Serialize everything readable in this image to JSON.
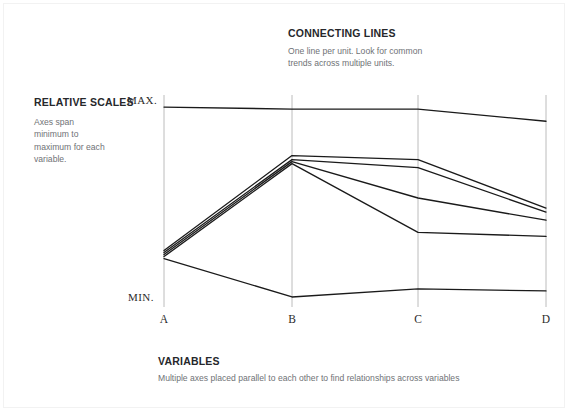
{
  "callouts": {
    "connecting": {
      "title": "CONNECTING LINES",
      "body": "One line per unit. Look for common trends across multiple units."
    },
    "relative": {
      "title": "RELATIVE SCALES",
      "body": "Axes span minimum to maximum for each variable."
    },
    "variables": {
      "title": "VARIABLES",
      "body": "Multiple axes placed parallel to each other to find relationships across variables"
    }
  },
  "chart_data": {
    "type": "line",
    "subtype": "parallel-coordinates",
    "title": "",
    "xlabel": "",
    "ylabel": "",
    "categories": [
      "A",
      "B",
      "C",
      "D"
    ],
    "axis_max_label": "MAX.",
    "axis_min_label": "MIN.",
    "ylim": [
      0,
      100
    ],
    "grid": false,
    "legend": "none",
    "line_color": "#1a1a1a",
    "axis_color": "#bcbcbc",
    "series": [
      {
        "name": "unit-1",
        "values": [
          96,
          95,
          95,
          89
        ]
      },
      {
        "name": "unit-2",
        "values": [
          25,
          72,
          70,
          46
        ]
      },
      {
        "name": "unit-3",
        "values": [
          24,
          70,
          66,
          44
        ]
      },
      {
        "name": "unit-4",
        "values": [
          23,
          69,
          51,
          40
        ]
      },
      {
        "name": "unit-5",
        "values": [
          22,
          68,
          34,
          32
        ]
      },
      {
        "name": "unit-6",
        "values": [
          21,
          2,
          6,
          5
        ]
      }
    ]
  }
}
